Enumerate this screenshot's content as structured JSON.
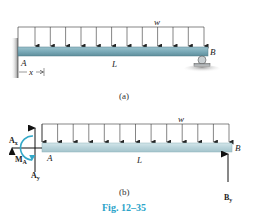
{
  "figure": {
    "caption": "Fig. 12–35",
    "caption_color": "#2aa3c9",
    "beam_color": "#7fb0bd",
    "moment_color": "#33a8c8"
  },
  "panel_a": {
    "label": "(a)",
    "load_label": "w",
    "span_label": "L",
    "left_end_label": "A",
    "right_end_label": "B",
    "dimension_label": "x",
    "load_arrow_count": 12,
    "left_support": "fixed-wall",
    "right_support": "roller"
  },
  "panel_b": {
    "label": "(b)",
    "load_label": "w",
    "span_label": "L",
    "left_end_label": "A",
    "right_end_label": "B",
    "load_arrow_count": 13,
    "reactions": {
      "ax": "A",
      "ax_sub": "x",
      "ay": "A",
      "ay_sub": "y",
      "ma": "M",
      "ma_sub": "A",
      "by": "B",
      "by_sub": "y"
    }
  }
}
